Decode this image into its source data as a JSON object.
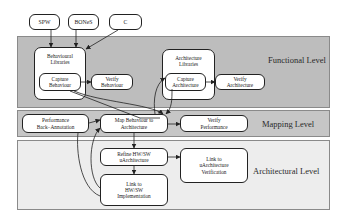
{
  "colors": {
    "functional_band": "#bdbdbd",
    "mapping_band": "#c6c6c6",
    "architectural_band": "#ededed",
    "box_fill": "#ffffff",
    "stroke": "#222222"
  },
  "sources": [
    {
      "id": "spw",
      "label": "SPW"
    },
    {
      "id": "bones",
      "label": "BONeS"
    },
    {
      "id": "c",
      "label": "C"
    }
  ],
  "levels": {
    "functional": {
      "label": "Functional Level",
      "behavioural_libraries": {
        "line1": "Behavioural",
        "line2": "Libraries"
      },
      "capture_behaviour": {
        "line1": "Capture",
        "line2": "Behaviour"
      },
      "verify_behaviour": {
        "line1": "Verify",
        "line2": "Behaviour"
      },
      "architecture_libraries": {
        "line1": "Architecture",
        "line2": "Libraries"
      },
      "capture_architecture": {
        "line1": "Capture",
        "line2": "Architecture"
      },
      "verify_architecture": {
        "line1": "Verify",
        "line2": "Architecture"
      }
    },
    "mapping": {
      "label": "Mapping Level",
      "performance_back_annotation": {
        "line1": "Performance",
        "line2": "Back−Annotation"
      },
      "map_behaviour": {
        "line1": "Map Behaviour to",
        "line2": "Architecture"
      },
      "verify_performance": {
        "line1": "Verify",
        "line2": "Performance"
      }
    },
    "architectural": {
      "label": "Architectural Level",
      "refine_hwsw": {
        "line1": "Refine HW/SW",
        "line2": "uArchitecture"
      },
      "link_uarch": {
        "line1": "Link to",
        "line2": "uArchitecture",
        "line3": "Verification"
      },
      "link_impl": {
        "line1": "Link to",
        "line2": "HW/SW",
        "line3": "Implementation"
      }
    }
  }
}
